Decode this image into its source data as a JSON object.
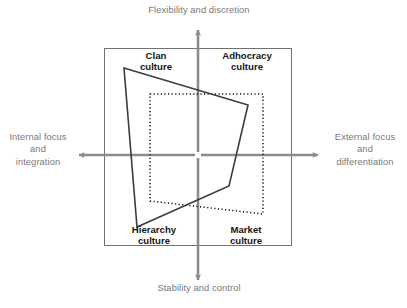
{
  "diagram": {
    "type": "competing-values-framework",
    "title": "",
    "colors": {
      "axis": "#8a8c8f",
      "axis_label_text": "#77787b",
      "quadrant_label_text": "#161616",
      "box_border": "#6f7174",
      "profile_solid": "#3c3c3c",
      "profile_dotted": "#111111",
      "background": "#ffffff"
    },
    "axes": {
      "top_label": "Flexibility and discretion",
      "bottom_label": "Stability and control",
      "left_label": "Internal focus\nand\nintegration",
      "right_label": "External focus\nand\ndifferentiation"
    },
    "quadrants": [
      {
        "name": "clan",
        "label": "Clan\nculture",
        "position": "top-left"
      },
      {
        "name": "adhocracy",
        "label": "Adhocracy\nculture",
        "position": "top-right"
      },
      {
        "name": "hierarchy",
        "label": "Hierarchy\nculture",
        "position": "bottom-left"
      },
      {
        "name": "market",
        "label": "Market\nculture",
        "position": "bottom-right"
      }
    ],
    "frame": {
      "x": 104,
      "y": 48,
      "width": 188,
      "height": 198
    },
    "origin": {
      "x": 198,
      "y": 155
    },
    "profiles": [
      {
        "name": "current-culture-profile",
        "style": "solid",
        "points": "124,68 248,105 229,186 137,227"
      },
      {
        "name": "preferred-culture-profile",
        "style": "dotted",
        "points": "150,94 263,94 263,214 150,201"
      }
    ],
    "arrows": {
      "up": {
        "from": [
          198,
          150
        ],
        "to": [
          198,
          27
        ]
      },
      "down": {
        "from": [
          198,
          160
        ],
        "to": [
          198,
          283
        ]
      },
      "left": {
        "from": [
          193,
          155
        ],
        "to": [
          76,
          155
        ]
      },
      "right": {
        "from": [
          203,
          155
        ],
        "to": [
          321,
          155
        ]
      }
    }
  }
}
